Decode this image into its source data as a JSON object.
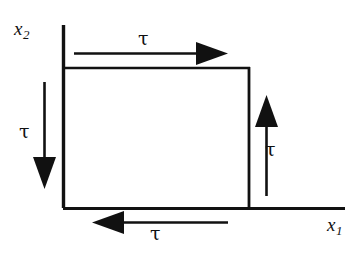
{
  "figure": {
    "kind": "shear-stress-element-diagram",
    "stroke_color": "#111111",
    "background_color": "#ffffff"
  },
  "axes": {
    "x_axis": {
      "name": "x1",
      "label": "x",
      "subscript": "1",
      "orientation": "horizontal",
      "from": [
        63,
        208
      ],
      "to": [
        345,
        208
      ]
    },
    "y_axis": {
      "name": "x2",
      "label": "x",
      "subscript": "2",
      "orientation": "vertical",
      "from": [
        63,
        208
      ],
      "to": [
        63,
        25
      ]
    }
  },
  "element": {
    "name": "stress-element-rectangle",
    "left": 63,
    "top": 67,
    "right": 250,
    "bottom": 208,
    "width": 187,
    "height": 141,
    "fill": "none"
  },
  "stress_arrows": [
    {
      "id": "top",
      "label": "τ",
      "direction": "right",
      "side": "top",
      "from": [
        74,
        53
      ],
      "to": [
        228,
        53
      ],
      "label_position": "above-center"
    },
    {
      "id": "left",
      "label": "τ",
      "direction": "down",
      "side": "left",
      "from": [
        44,
        82
      ],
      "to": [
        44,
        188
      ],
      "label_position": "left-center"
    },
    {
      "id": "right",
      "label": "τ",
      "direction": "up",
      "side": "right",
      "from": [
        266,
        196
      ],
      "to": [
        266,
        96
      ],
      "label_position": "right-center"
    },
    {
      "id": "bottom",
      "label": "τ",
      "direction": "left",
      "side": "bottom",
      "from": [
        228,
        222
      ],
      "to": [
        92,
        222
      ],
      "label_position": "below-center"
    }
  ],
  "labels": {
    "tau_symbol": "τ",
    "x_axis_base": "x",
    "x_axis_sub": "1",
    "y_axis_base": "x",
    "y_axis_sub": "2"
  }
}
